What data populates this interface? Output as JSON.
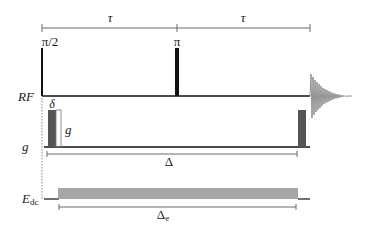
{
  "diagram": {
    "type": "pulse-sequence",
    "title": "",
    "timing": {
      "tau_first_label": "τ",
      "tau_second_label": "τ",
      "delta_label": "Δ",
      "delta_e_label": "Δ",
      "delta_e_subscript": "e"
    },
    "rf_channel": {
      "label": "RF",
      "pulse_90_label": "π/2",
      "pulse_180_label": "π",
      "has_fid": true
    },
    "gradient_channel": {
      "label": "g",
      "delta_label": "δ",
      "amplitude_label": "g"
    },
    "edc_channel": {
      "label": "E",
      "subscript": "dc"
    },
    "colors": {
      "line": "#111111",
      "gradient_fill": "#555555",
      "edc_fill": "#a6a6a6",
      "bracket": "#6a6a6a",
      "dotted": "#888888"
    }
  }
}
